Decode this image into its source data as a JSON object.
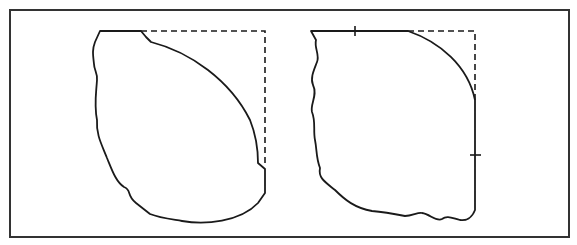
{
  "figure": {
    "frame": {
      "x": 10,
      "y": 10,
      "width": 559,
      "height": 227,
      "stroke": "#333333"
    },
    "line_color": "#1a1a1a",
    "panels": [
      {
        "name": "left-panel",
        "solid_outline": "M100,31 L141,31 L146,37 L151,42 C190,52 230,80 250,120 C256,135 258,150 258,163 L265,169 L265,193 L258,203 C240,222 205,225 182,221 C170,219 160,218 150,214 L136,203 C126,195 132,190 124,187 C116,182 112,170 107,158 C102,145 96,135 97,120 C94,105 96,95 97,80 C98,74 94,70 94,64 C93,55 92,50 95,42 Z",
        "dashed_outline": "M141,31 L265,31 L265,163",
        "ticks": []
      },
      {
        "name": "right-panel",
        "solid_outline": "M311,31 L408,31 C440,42 468,66 475,100 L475,210 C472,218 466,221 460,220 C452,218 447,215 442,219 C436,222 430,214 422,213 C418,212 412,216 405,216 C395,214 385,212 372,211 C355,208 345,200 335,190 C325,182 318,178 320,168 C316,158 317,150 315,140 C313,130 316,122 312,112 C310,104 318,95 313,85 C310,78 314,70 317,62 C320,55 314,48 316,40 Z",
        "dashed_outline": "M408,31 L475,31 L475,100",
        "ticks": [
          {
            "x1": 355,
            "y1": 26,
            "x2": 355,
            "y2": 36
          },
          {
            "x1": 470,
            "y1": 155,
            "x2": 481,
            "y2": 155
          }
        ]
      }
    ],
    "caption": ""
  }
}
